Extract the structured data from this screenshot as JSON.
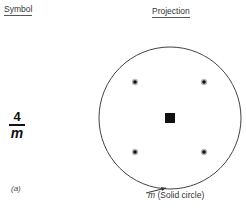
{
  "headers": {
    "symbol": "Symbol",
    "projection": "Projection"
  },
  "symbol": {
    "numerator": "4",
    "denominator": "m"
  },
  "caption": "(a)",
  "projection": {
    "circle_type": "solid",
    "circle_center": [
      170,
      118
    ],
    "circle_radius": 71,
    "poles": [
      {
        "x": 135,
        "y": 82
      },
      {
        "x": 204,
        "y": 82
      },
      {
        "x": 135,
        "y": 152
      },
      {
        "x": 204,
        "y": 152
      }
    ],
    "axis_symbol": "filled-square",
    "axis_position": [
      170,
      118
    ]
  },
  "annotation": {
    "mirror_label": "m",
    "description": "(Solid circle)"
  }
}
